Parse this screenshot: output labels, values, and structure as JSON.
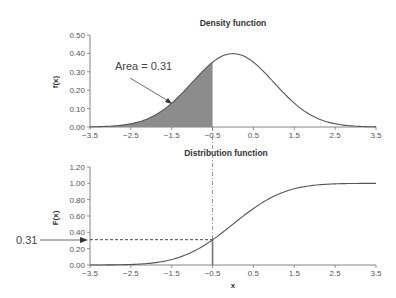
{
  "chart_data": [
    {
      "type": "area",
      "title": "Density function",
      "xlabel": "",
      "ylabel": "f(x)",
      "xlim": [
        -3.5,
        3.5
      ],
      "ylim": [
        0,
        0.5
      ],
      "x_ticks": [
        "-3.5",
        "-2.5",
        "-1.5",
        "-0.5",
        "0.5",
        "1.5",
        "2.5",
        "3.5"
      ],
      "y_ticks": [
        "0.00",
        "0.10",
        "0.20",
        "0.30",
        "0.40",
        "0.50"
      ],
      "curve": "normal pdf, mean 0, sd 1",
      "shaded_region": {
        "from": -3.5,
        "to": -0.5,
        "color": "#8c8c8c"
      },
      "annotation": "Area = 0.31",
      "x": [
        -3.5,
        -3.0,
        -2.5,
        -2.0,
        -1.5,
        -1.0,
        -0.5,
        0.0,
        0.5,
        1.0,
        1.5,
        2.0,
        2.5,
        3.0,
        3.5
      ],
      "values": [
        0.001,
        0.004,
        0.018,
        0.054,
        0.13,
        0.242,
        0.352,
        0.399,
        0.352,
        0.242,
        0.13,
        0.054,
        0.018,
        0.004,
        0.001
      ],
      "grid": false
    },
    {
      "type": "line",
      "title": "Distribution function",
      "xlabel": "x",
      "ylabel": "F(x)",
      "xlim": [
        -3.5,
        3.5
      ],
      "ylim": [
        0,
        1.2
      ],
      "x_ticks": [
        "-3.5",
        "-2.5",
        "-1.5",
        "-0.5",
        "0.5",
        "1.5",
        "2.5",
        "3.5"
      ],
      "y_ticks": [
        "0.00",
        "0.20",
        "0.40",
        "0.60",
        "0.80",
        "1.00",
        "1.20"
      ],
      "curve": "normal cdf, mean 0, sd 1",
      "annotation": "0.31",
      "reference_point": {
        "x": -0.5,
        "y": 0.31
      },
      "x": [
        -3.5,
        -3.0,
        -2.5,
        -2.0,
        -1.5,
        -1.0,
        -0.5,
        0.0,
        0.5,
        1.0,
        1.5,
        2.0,
        2.5,
        3.0,
        3.5
      ],
      "values": [
        0.0,
        0.001,
        0.006,
        0.023,
        0.067,
        0.159,
        0.309,
        0.5,
        0.691,
        0.841,
        0.933,
        0.977,
        0.994,
        0.999,
        1.0
      ],
      "grid": false
    }
  ],
  "labels": {
    "top_title": "Density function",
    "top_ylabel": "f(x)",
    "top_annotation": "Area = 0.31",
    "bottom_title": "Distribution function",
    "bottom_ylabel": "F(x)",
    "bottom_xlabel": "x",
    "bottom_annotation": "0.31"
  }
}
